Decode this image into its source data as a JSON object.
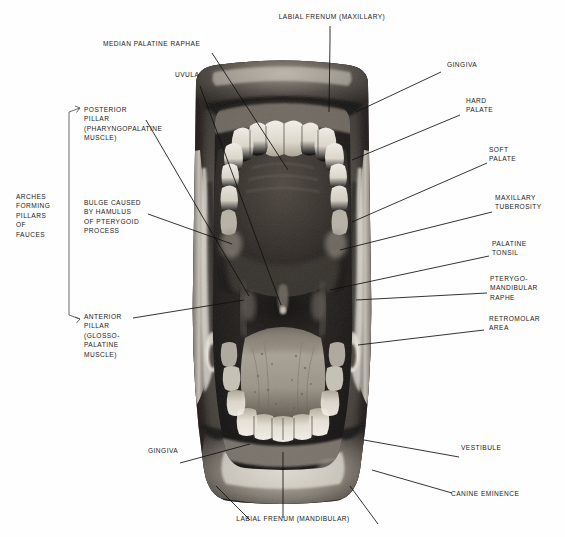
{
  "figure": {
    "background_color": "#ffffff",
    "text_color": "#1a1a1a",
    "leader_line_color": "#111111"
  },
  "group_bracket": {
    "label": "ARCHES\nFORMING\nPILLARS\nOF\nFAUCES",
    "members": [
      "POSTERIOR PILLAR (PHARYNGOPALATINE MUSCLE)",
      "ANTERIOR PILLAR (GLOSSO-PALATINE MUSCLE)"
    ]
  },
  "labels": {
    "labial_frenum_maxillary": "LABIAL FRENUM (MAXILLARY)",
    "median_palatine_raphae": "MEDIAN PALATINE RAPHAE",
    "uvula": "UVULA",
    "posterior_pillar": "POSTERIOR\nPILLAR\n(PHARYNGOPALATINE\nMUSCLE)",
    "bulge_hamulus": "BULGE CAUSED\nBY HAMULUS\nOF PTERYGOID\nPROCESS",
    "anterior_pillar": "ANTERIOR\nPILLAR\n(GLOSSO-\nPALATINE\nMUSCLE)",
    "gingiva_lower_left": "GINGIVA",
    "labial_frenum_mandibular": "LABIAL FRENUM (MANDIBULAR)",
    "gingiva_upper_right": "GINGIVA",
    "hard_palate": "HARD\nPALATE",
    "soft_palate": "SOFT\nPALATE",
    "maxillary_tuberosity": "MAXILLARY\nTUBEROSITY",
    "palatine_tonsil": "PALATINE\nTONSIL",
    "pterygomandibular_raphe": "PTERYGO-\nMANDIBULAR\nRAPHE",
    "retromolar_area": "RETROMOLAR\nAREA",
    "vestibule": "VESTIBULE",
    "canine_eminence": "CANINE EMINENCE"
  },
  "photo": {
    "description": "black-and-white intraoral photograph of an open mouth viewed from the front",
    "structures": [
      "upper lip",
      "maxillary teeth",
      "hard palate",
      "soft palate",
      "uvula",
      "tongue",
      "mandibular teeth",
      "lower lip",
      "buccal vestibule"
    ],
    "tone_dark": "#221f1d",
    "tone_mid": "#6b6560",
    "tone_light": "#e8e4dd"
  }
}
